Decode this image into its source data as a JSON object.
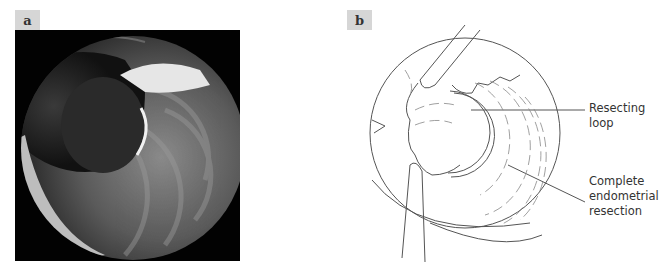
{
  "panels": {
    "a": {
      "label": "a",
      "kind": "endoscopic-photograph"
    },
    "b": {
      "label": "b",
      "kind": "line-drawing"
    }
  },
  "annotations": [
    {
      "id": "loop",
      "text": "Resecting\nloop"
    },
    {
      "id": "resection",
      "text": "Complete\nendometrial\nresection"
    }
  ],
  "colors": {
    "label_bg": "#d6d6d6",
    "line": "#555555",
    "photo_bg": "#020202"
  }
}
